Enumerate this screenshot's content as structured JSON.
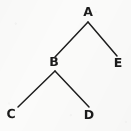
{
  "figure": {
    "kind": "binary-tree-diagram",
    "width": 131,
    "height": 131,
    "background_color": "#fbfbfa",
    "ink_color": "#1b1b1b",
    "edge_color": "#1e1e1e",
    "edge_width": 1.5
  },
  "tree": {
    "root": "A",
    "nodes": [
      {
        "id": "A",
        "label": "A",
        "x": 88,
        "y": 12,
        "level": 0
      },
      {
        "id": "B",
        "label": "B",
        "x": 54,
        "y": 62,
        "level": 1
      },
      {
        "id": "E",
        "label": "E",
        "x": 118,
        "y": 63,
        "level": 1
      },
      {
        "id": "C",
        "label": "C",
        "x": 11,
        "y": 114,
        "level": 2
      },
      {
        "id": "D",
        "label": "D",
        "x": 89,
        "y": 115,
        "level": 2
      }
    ],
    "edges": [
      {
        "from": "A",
        "to": "B",
        "x1": 88,
        "y1": 22,
        "x2": 55,
        "y2": 57
      },
      {
        "from": "A",
        "to": "E",
        "x1": 88,
        "y1": 22,
        "x2": 117,
        "y2": 56
      },
      {
        "from": "B",
        "to": "C",
        "x1": 55,
        "y1": 71,
        "x2": 18,
        "y2": 107
      },
      {
        "from": "B",
        "to": "D",
        "x1": 55,
        "y1": 71,
        "x2": 89,
        "y2": 107
      }
    ]
  }
}
